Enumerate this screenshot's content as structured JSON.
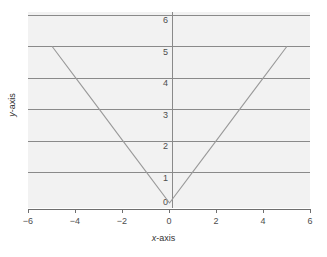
{
  "chart_data": {
    "type": "line",
    "title": "",
    "subtitle": "",
    "xlabel": "x-axis",
    "ylabel": "y-axis",
    "xlim": [
      -6,
      6
    ],
    "ylim": [
      0,
      6.2
    ],
    "xticks": [
      -6,
      -4,
      -2,
      0,
      2,
      4,
      6
    ],
    "xticklabels": [
      "−6",
      "−4",
      "−2",
      "0",
      "2",
      "4",
      "6"
    ],
    "yticks": [
      0,
      1,
      2,
      3,
      4,
      5,
      6
    ],
    "yticklabels": [
      "0",
      "1",
      "2",
      "3",
      "4",
      "5",
      "6"
    ],
    "grid": "horizontal",
    "gridlines_at": [
      1,
      2,
      3,
      4,
      5,
      6
    ],
    "legend": null,
    "series": [
      {
        "name": "y = |x|",
        "x": [
          -5,
          -4,
          -3,
          -2,
          -1,
          0,
          1,
          2,
          3,
          4,
          5
        ],
        "values": [
          5,
          4,
          3,
          2,
          1,
          0,
          1,
          2,
          3,
          4,
          5
        ],
        "color": "#9a9a9a"
      }
    ],
    "colors": {
      "panel_background": "#f2f2f2",
      "gridline": "#8a8a8a",
      "axis": "#6f6f6f",
      "series": "#9a9a9a",
      "text": "#4d4d4d",
      "figure_background": "#ffffff"
    }
  },
  "axis_titles": {
    "x_var": "x",
    "x_suffix": "-axis",
    "y_var": "y",
    "y_suffix": "-axis"
  }
}
